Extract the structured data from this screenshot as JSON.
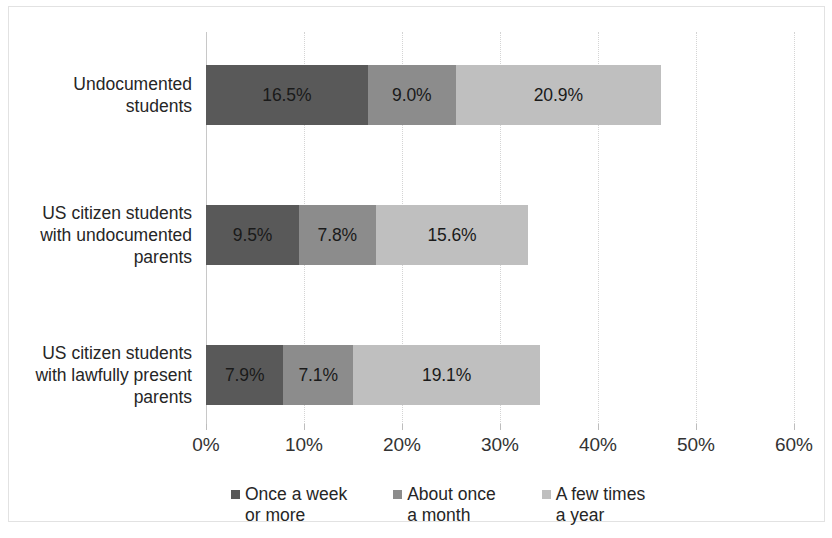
{
  "chart_data": {
    "type": "bar",
    "orientation": "horizontal",
    "stacked": true,
    "title": "",
    "xlabel": "",
    "ylabel": "",
    "xlim": [
      0,
      60
    ],
    "xtick_step": 10,
    "grid": true,
    "legend_position": "bottom",
    "categories": [
      "Undocumented\nstudents",
      "US citizen students\nwith undocumented\nparents",
      "US citizen students\nwith lawfully present\nparents"
    ],
    "tick_labels": [
      "0%",
      "10%",
      "20%",
      "30%",
      "40%",
      "50%",
      "60%"
    ],
    "series": [
      {
        "name": "Once a week\nor more",
        "color": "#595959",
        "values": [
          16.5,
          9.5,
          7.9
        ],
        "labels": [
          "16.5%",
          "9.5%",
          "7.9%"
        ]
      },
      {
        "name": "About once\na month",
        "color": "#8c8c8c",
        "values": [
          9.0,
          7.8,
          7.1
        ],
        "labels": [
          "9.0%",
          "7.8%",
          "7.1%"
        ]
      },
      {
        "name": "A few times\na year",
        "color": "#bfbfbf",
        "values": [
          20.9,
          15.6,
          19.1
        ],
        "labels": [
          "20.9%",
          "15.6%",
          "19.1%"
        ]
      }
    ],
    "totals": [
      46.4,
      32.9,
      34.1
    ]
  },
  "caption": ""
}
